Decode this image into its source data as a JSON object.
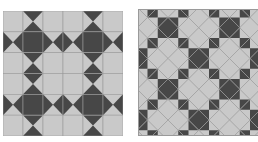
{
  "colors": {
    "light": "#c9c9c9",
    "dark": "#474747",
    "seam": "#9a9a9a",
    "background": "#ffffff"
  },
  "left_quilt": {
    "description": "Straight-set star quilt, 6x6 grid",
    "grid": [
      [
        "L",
        "V",
        "L",
        "L",
        "V",
        "L"
      ],
      [
        "H",
        "D",
        "H",
        "H",
        "D",
        "H"
      ],
      [
        "L",
        "V",
        "L",
        "L",
        "V",
        "L"
      ],
      [
        "L",
        "V",
        "L",
        "L",
        "V",
        "L"
      ],
      [
        "H",
        "D",
        "H",
        "H",
        "D",
        "H"
      ],
      [
        "L",
        "V",
        "L",
        "L",
        "V",
        "L"
      ]
    ],
    "legend": {
      "L": "light square",
      "D": "dark square",
      "V": "hourglass, dark top and bottom",
      "H": "hourglass, dark left and right"
    }
  },
  "right_quilt": {
    "description": "On-point (45 degree) star quilt",
    "rotation_deg": 45,
    "cell_size": 14.5
  }
}
